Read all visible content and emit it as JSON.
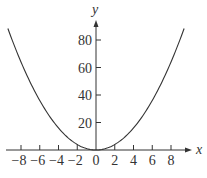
{
  "chart_data": {
    "type": "line",
    "title": "",
    "xlabel": "x",
    "ylabel": "y",
    "function": "y = x^2",
    "xlim": [
      -9.4,
      9.4
    ],
    "ylim": [
      0,
      88
    ],
    "grid": false,
    "legend": null,
    "x_ticks": [
      -8,
      -6,
      -4,
      -2,
      0,
      2,
      4,
      6,
      8
    ],
    "x_tick_labels": [
      "−8",
      "−6",
      "−4",
      "−2",
      "0",
      "2",
      "4",
      "6",
      "8"
    ],
    "y_ticks": [
      20,
      40,
      60,
      80
    ],
    "y_tick_labels": [
      "20",
      "40",
      "60",
      "80"
    ],
    "series": [
      {
        "name": "y = x^2",
        "x": [
          -9.4,
          -8,
          -6,
          -4,
          -2,
          0,
          2,
          4,
          6,
          8,
          9.4
        ],
        "values": [
          88.36,
          64,
          36,
          16,
          4,
          0,
          4,
          16,
          36,
          64,
          88.36
        ]
      }
    ],
    "colors": {
      "curve": "#333333",
      "axes": "#333333",
      "text": "#333333"
    }
  },
  "layout": {
    "origin_px": [
      96,
      150
    ],
    "px_per_x_unit": 9.375,
    "px_per_y_unit": 1.375,
    "x_axis_extent_px": [
      6,
      192
    ],
    "y_axis_extent_px": [
      150,
      20
    ]
  }
}
